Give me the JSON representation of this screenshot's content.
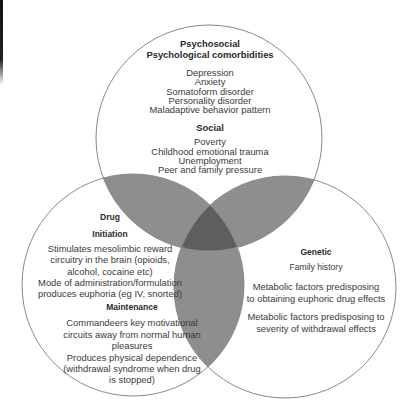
{
  "diagram": {
    "type": "venn",
    "colors": {
      "circle_fill": "#ffffff",
      "circle_stroke": "#8a8a8a",
      "pair_overlap": "#8e8e8e",
      "triple_overlap": "#5e5e5e"
    },
    "circles": [
      {
        "id": "psychosocial",
        "title": "Psychosocial",
        "sections": [
          {
            "heading": "Psychological comorbidities",
            "items": [
              "Depression",
              "Anxiety",
              "Somatoform disorder",
              "Personality disorder",
              "Maladaptive behavior pattern"
            ]
          },
          {
            "heading": "Social",
            "items": [
              "Poverty",
              "Childhood emotional trauma",
              "Unemployment",
              "Peer and family pressure"
            ]
          }
        ]
      },
      {
        "id": "drug",
        "title": "Drug",
        "sections": [
          {
            "heading": "Initiation",
            "items": [
              "Stimulates mesolimbic reward",
              "circuitry in the brain (opioids,",
              "alcohol, cocaine etc)",
              "Mode of administration/formulation",
              "produces euphoria (eg IV, snorted)"
            ]
          },
          {
            "heading": "Maintenance",
            "items": [
              "Commandeers key motivational",
              "circuits away from normal human",
              "pleasures",
              "Produces physical dependence",
              "(withdrawal syndrome when drug",
              "is stopped)"
            ]
          }
        ]
      },
      {
        "id": "genetic",
        "title": "Genetic",
        "sections": [
          {
            "items": [
              "Family history"
            ]
          },
          {
            "items": [
              "Metabolic factors predisposing",
              "to obtaining euphoric drug effects"
            ]
          },
          {
            "items": [
              "Metabolic factors predisposing to",
              "severity of withdrawal effects"
            ]
          }
        ]
      }
    ]
  }
}
